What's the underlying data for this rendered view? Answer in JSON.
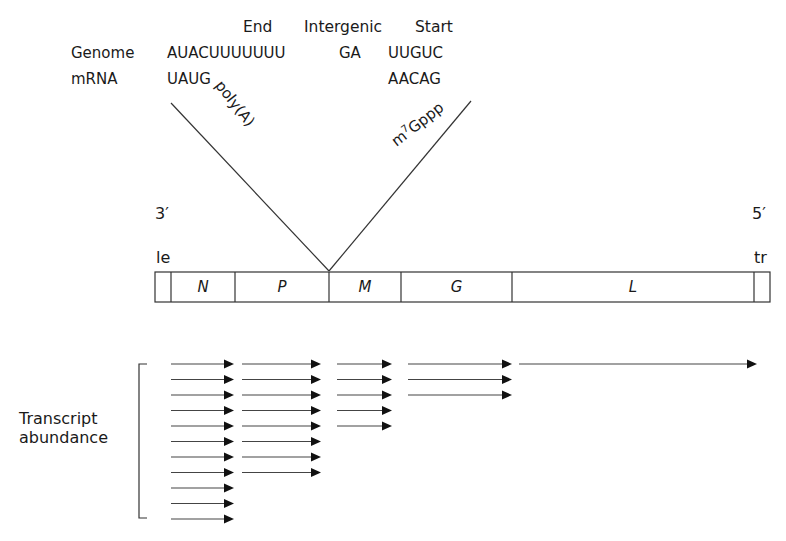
{
  "header": {
    "end_label": "End",
    "intergenic_label": "Intergenic",
    "start_label": "Start"
  },
  "sequences": {
    "genome": {
      "label": "Genome",
      "end": "AUACUUUUUUU",
      "intergenic": "GA",
      "start": "UUGUC"
    },
    "mrna": {
      "label": "mRNA",
      "end": "UAUG",
      "start": "AACAG"
    }
  },
  "annotations": {
    "polyA": "poly(A)",
    "cap_prefix": "m",
    "cap_superscript": "7",
    "cap_suffix": "Gppp"
  },
  "ends": {
    "left": "3′",
    "right": "5′",
    "leader": "le",
    "trailer": "tr"
  },
  "genome_map": {
    "genes": [
      {
        "name": "N",
        "x0": 171,
        "x1": 235
      },
      {
        "name": "P",
        "x0": 235,
        "x1": 329
      },
      {
        "name": "M",
        "x0": 329,
        "x1": 401
      },
      {
        "name": "G",
        "x0": 401,
        "x1": 512
      },
      {
        "name": "L",
        "x0": 512,
        "x1": 754
      }
    ],
    "leader_region": {
      "x0": 155,
      "x1": 171
    },
    "trailer_region": {
      "x0": 754,
      "x1": 770
    }
  },
  "transcripts": {
    "label_line1": "Transcript",
    "label_line2": "abundance",
    "groups": [
      {
        "gene": "N",
        "count": 11,
        "x0": 171,
        "x1": 234
      },
      {
        "gene": "P",
        "count": 8,
        "x0": 242,
        "x1": 321
      },
      {
        "gene": "M",
        "count": 5,
        "x0": 337,
        "x1": 392
      },
      {
        "gene": "G",
        "count": 3,
        "x0": 408,
        "x1": 512
      },
      {
        "gene": "L",
        "count": 1,
        "x0": 519,
        "x1": 757
      }
    ]
  },
  "colors": {
    "ink": "#1a1a1a",
    "line": "#333333",
    "background": "#ffffff"
  }
}
